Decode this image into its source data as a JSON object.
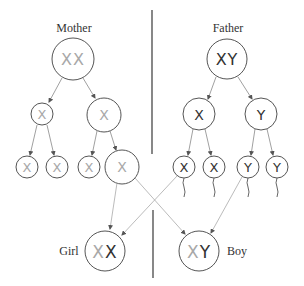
{
  "diagram": {
    "labels": {
      "mother": "Mother",
      "father": "Father",
      "girl": "Girl",
      "boy": "Boy"
    },
    "colors": {
      "maternal_chromosome": "#a8a8a8",
      "paternal_chromosome": "#333333",
      "cell_outline": "#555555",
      "arrow": "#888888"
    },
    "mother": {
      "parent": {
        "chromosomes": [
          "X",
          "X"
        ]
      },
      "meiosis_1": [
        {
          "chromosome": "X"
        },
        {
          "chromosome": "X"
        }
      ],
      "gametes": [
        {
          "chromosome": "X"
        },
        {
          "chromosome": "X"
        },
        {
          "chromosome": "X"
        },
        {
          "chromosome": "X",
          "type": "egg"
        }
      ]
    },
    "father": {
      "parent": {
        "chromosomes": [
          "X",
          "Y"
        ]
      },
      "meiosis_1": [
        {
          "chromosome": "X"
        },
        {
          "chromosome": "Y"
        }
      ],
      "gametes": [
        {
          "chromosome": "X",
          "type": "sperm"
        },
        {
          "chromosome": "X",
          "type": "sperm"
        },
        {
          "chromosome": "Y",
          "type": "sperm"
        },
        {
          "chromosome": "Y",
          "type": "sperm"
        }
      ]
    },
    "offspring": {
      "girl": {
        "maternal": "X",
        "paternal": "X"
      },
      "boy": {
        "maternal": "X",
        "paternal": "Y"
      }
    }
  }
}
